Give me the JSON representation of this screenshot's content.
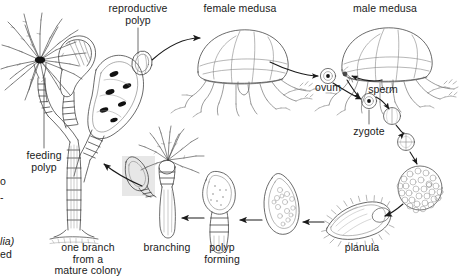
{
  "figure": {
    "width": 460,
    "height": 277,
    "background_color": "#ffffff",
    "ink_color": "#1a1a1a",
    "highlight_color": "#e3e3e3"
  },
  "labels": {
    "reproductive_polyp": "reproductive\npolyp",
    "female_medusa": "female medusa",
    "male_medusa": "male medusa",
    "ovum": "ovum",
    "sperm": "sperm",
    "zygote": "zygote",
    "planula": "planula",
    "polyp_forming": "polyp\nforming",
    "branching": "branching",
    "one_branch": "one branch\nfrom a\nmature colony",
    "feeding_polyp": "feeding\npolyp",
    "clipped_left_top": "o",
    "clipped_left_mid": "-",
    "clipped_left_genus": "lia)",
    "clipped_left_bottom": "ed"
  },
  "stages": [
    {
      "id": "colony",
      "name": "one branch from a mature colony"
    },
    {
      "id": "feeding-polyp",
      "name": "feeding polyp"
    },
    {
      "id": "reproductive-polyp",
      "name": "reproductive polyp"
    },
    {
      "id": "female-medusa",
      "name": "female medusa"
    },
    {
      "id": "male-medusa",
      "name": "male medusa"
    },
    {
      "id": "ovum",
      "name": "ovum"
    },
    {
      "id": "sperm",
      "name": "sperm"
    },
    {
      "id": "zygote",
      "name": "zygote"
    },
    {
      "id": "two-cell",
      "name": "two-cell cleavage stage"
    },
    {
      "id": "four-cell",
      "name": "four-cell cleavage stage"
    },
    {
      "id": "morula",
      "name": "morula / blastula"
    },
    {
      "id": "planula",
      "name": "planula larva"
    },
    {
      "id": "settled-planula",
      "name": "settled planula"
    },
    {
      "id": "polyp-forming",
      "name": "polyp forming"
    },
    {
      "id": "branching",
      "name": "branching"
    }
  ]
}
